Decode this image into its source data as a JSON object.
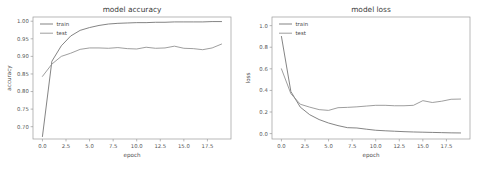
{
  "figure": {
    "background_color": "#ffffff",
    "panel_count": 2
  },
  "chart_data": [
    {
      "type": "line",
      "id": "model-accuracy",
      "title": "model accuracy",
      "xlabel": "epoch",
      "ylabel": "accuracy",
      "xlim": [
        -1.0,
        20.0
      ],
      "ylim": [
        0.665,
        1.012
      ],
      "xticks": [
        0.0,
        2.5,
        5.0,
        7.5,
        10.0,
        12.5,
        15.0,
        17.5
      ],
      "xtick_labels": [
        "0.0",
        "2.5",
        "5.0",
        "7.5",
        "10.0",
        "12.5",
        "15.0",
        "17.5"
      ],
      "yticks": [
        0.7,
        0.75,
        0.8,
        0.85,
        0.9,
        0.95,
        1.0
      ],
      "ytick_labels": [
        "0.70",
        "0.75",
        "0.80",
        "0.85",
        "0.90",
        "0.95",
        "1.00"
      ],
      "grid": false,
      "legend_position": "upper left",
      "x": [
        0,
        1,
        2,
        3,
        4,
        5,
        6,
        7,
        8,
        9,
        10,
        11,
        12,
        13,
        14,
        15,
        16,
        17,
        18,
        19
      ],
      "series": [
        {
          "name": "train",
          "color": "#6e6e6e",
          "values": [
            0.672,
            0.886,
            0.93,
            0.958,
            0.974,
            0.982,
            0.988,
            0.992,
            0.994,
            0.995,
            0.996,
            0.996,
            0.997,
            0.997,
            0.998,
            0.998,
            0.998,
            0.998,
            0.999,
            0.999
          ]
        },
        {
          "name": "test",
          "color": "#8c8c8c",
          "values": [
            0.843,
            0.878,
            0.9,
            0.909,
            0.92,
            0.924,
            0.924,
            0.923,
            0.925,
            0.922,
            0.921,
            0.926,
            0.923,
            0.924,
            0.929,
            0.923,
            0.922,
            0.919,
            0.924,
            0.935
          ]
        }
      ]
    },
    {
      "type": "line",
      "id": "model-loss",
      "title": "model loss",
      "xlabel": "epoch",
      "ylabel": "loss",
      "xlim": [
        -1.0,
        20.0
      ],
      "ylim": [
        -0.05,
        1.08
      ],
      "xticks": [
        0.0,
        2.5,
        5.0,
        7.5,
        10.0,
        12.5,
        15.0,
        17.5
      ],
      "xtick_labels": [
        "0.0",
        "2.5",
        "5.0",
        "7.5",
        "10.0",
        "12.5",
        "15.0",
        "17.5"
      ],
      "yticks": [
        0.0,
        0.2,
        0.4,
        0.6,
        0.8,
        1.0
      ],
      "ytick_labels": [
        "0.0",
        "0.2",
        "0.4",
        "0.6",
        "0.8",
        "1.0"
      ],
      "grid": false,
      "legend_position": "upper left",
      "x": [
        0,
        1,
        2,
        3,
        4,
        5,
        6,
        7,
        8,
        9,
        10,
        11,
        12,
        13,
        14,
        15,
        16,
        17,
        18,
        19
      ],
      "series": [
        {
          "name": "train",
          "color": "#6e6e6e",
          "values": [
            0.9,
            0.39,
            0.245,
            0.175,
            0.13,
            0.098,
            0.074,
            0.055,
            0.052,
            0.041,
            0.031,
            0.026,
            0.022,
            0.018,
            0.015,
            0.013,
            0.011,
            0.009,
            0.007,
            0.006
          ]
        },
        {
          "name": "test",
          "color": "#8c8c8c",
          "values": [
            0.6,
            0.37,
            0.272,
            0.245,
            0.222,
            0.215,
            0.24,
            0.243,
            0.248,
            0.255,
            0.262,
            0.262,
            0.258,
            0.258,
            0.262,
            0.305,
            0.288,
            0.3,
            0.318,
            0.32
          ]
        }
      ]
    }
  ]
}
